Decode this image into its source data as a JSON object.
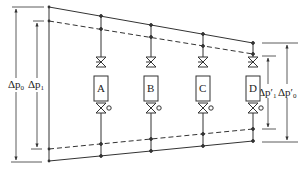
{
  "diagram": {
    "type": "hydraulic-pressure-distribution",
    "left_labels": {
      "outer": {
        "symbol": "Δp",
        "subscript": "0"
      },
      "inner": {
        "symbol": "Δp",
        "subscript": "1"
      }
    },
    "right_labels": {
      "inner": {
        "symbol": "Δp′",
        "subscript": "1"
      },
      "outer": {
        "symbol": "Δp′",
        "subscript": "0"
      }
    },
    "units": [
      {
        "label": "A"
      },
      {
        "label": "B"
      },
      {
        "label": "C"
      },
      {
        "label": "D"
      }
    ],
    "colors": {
      "line": "#333333",
      "background": "#ffffff"
    }
  }
}
